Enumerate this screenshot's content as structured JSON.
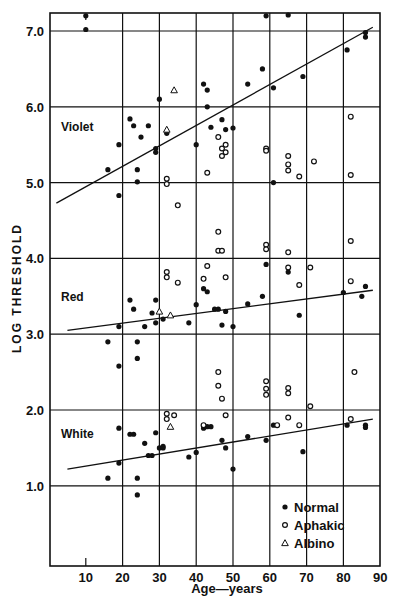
{
  "chart_data": {
    "type": "scatter",
    "title": "",
    "xlabel": "Age—years",
    "ylabel": "LOG THRESHOLD",
    "xlim": [
      2,
      90
    ],
    "ylim": [
      0,
      7.25
    ],
    "x_ticks": [
      10,
      20,
      30,
      40,
      50,
      60,
      70,
      80,
      90
    ],
    "y_ticks": [
      1.0,
      2.0,
      3.0,
      4.0,
      5.0,
      6.0,
      7.0
    ],
    "y_tick_labels": [
      "1.0",
      "2.0",
      "3.0",
      "4.0",
      "5.0",
      "6.0",
      "7.0"
    ],
    "grid": true,
    "legend_position": "lower right (inside)",
    "legend": [
      {
        "label": "Normal",
        "marker": "filled-circle"
      },
      {
        "label": "Aphakic",
        "marker": "open-circle"
      },
      {
        "label": "Albino",
        "marker": "open-triangle"
      }
    ],
    "group_labels": [
      {
        "text": "Violet",
        "age": 5,
        "value": 5.75
      },
      {
        "text": "Red",
        "age": 5,
        "value": 3.5
      },
      {
        "text": "White",
        "age": 5,
        "value": 1.7
      }
    ],
    "regression_lines": [
      {
        "name": "Violet",
        "x": [
          2,
          88
        ],
        "y": [
          4.73,
          7.05
        ]
      },
      {
        "name": "Red",
        "x": [
          5,
          88
        ],
        "y": [
          3.05,
          3.58
        ]
      },
      {
        "name": "White",
        "x": [
          5,
          88
        ],
        "y": [
          1.22,
          1.88
        ]
      }
    ],
    "series": [
      {
        "name": "Normal",
        "group": "Violet",
        "marker": "filled-circle",
        "points": [
          [
            10,
            7.2
          ],
          [
            10,
            7.02
          ],
          [
            16,
            5.17
          ],
          [
            19,
            5.5
          ],
          [
            19,
            4.83
          ],
          [
            22,
            5.84
          ],
          [
            23,
            5.75
          ],
          [
            24,
            5.17
          ],
          [
            24,
            5.01
          ],
          [
            25,
            5.6
          ],
          [
            27,
            5.75
          ],
          [
            29,
            5.4
          ],
          [
            29,
            5.45
          ],
          [
            30,
            6.1
          ],
          [
            32,
            5.65
          ],
          [
            40,
            5.5
          ],
          [
            42,
            6.3
          ],
          [
            43,
            6.22
          ],
          [
            43,
            6.0
          ],
          [
            44,
            5.73
          ],
          [
            47,
            5.83
          ],
          [
            48,
            5.7
          ],
          [
            50,
            5.72
          ],
          [
            54,
            6.3
          ],
          [
            58,
            6.5
          ],
          [
            59,
            7.2
          ],
          [
            61,
            6.25
          ],
          [
            61,
            5.0
          ],
          [
            65,
            7.22
          ],
          [
            69,
            6.4
          ],
          [
            81,
            6.75
          ],
          [
            86,
            6.92
          ],
          [
            86,
            6.98
          ]
        ]
      },
      {
        "name": "Aphakic",
        "group": "Violet",
        "marker": "open-circle",
        "points": [
          [
            32,
            5.05
          ],
          [
            32,
            4.98
          ],
          [
            35,
            4.7
          ],
          [
            43,
            5.13
          ],
          [
            46,
            5.6
          ],
          [
            47,
            5.45
          ],
          [
            47,
            5.35
          ],
          [
            48,
            5.5
          ],
          [
            48,
            5.4
          ],
          [
            59,
            5.45
          ],
          [
            59,
            5.42
          ],
          [
            65,
            5.35
          ],
          [
            65,
            5.24
          ],
          [
            65,
            5.16
          ],
          [
            68,
            5.08
          ],
          [
            72,
            5.28
          ],
          [
            82,
            5.87
          ],
          [
            82,
            5.1
          ]
        ]
      },
      {
        "name": "Albino",
        "group": "Violet",
        "marker": "open-triangle",
        "points": [
          [
            34,
            6.22
          ],
          [
            32,
            5.7
          ]
        ]
      },
      {
        "name": "Normal",
        "group": "Red",
        "marker": "filled-circle",
        "points": [
          [
            16,
            2.9
          ],
          [
            19,
            3.1
          ],
          [
            19,
            2.58
          ],
          [
            22,
            3.45
          ],
          [
            23,
            3.33
          ],
          [
            24,
            2.9
          ],
          [
            24,
            2.68
          ],
          [
            26,
            3.1
          ],
          [
            28,
            3.28
          ],
          [
            29,
            3.15
          ],
          [
            29,
            3.45
          ],
          [
            31,
            3.2
          ],
          [
            38,
            3.15
          ],
          [
            40,
            3.39
          ],
          [
            42,
            3.6
          ],
          [
            43,
            3.56
          ],
          [
            45,
            3.33
          ],
          [
            46,
            3.33
          ],
          [
            47,
            3.12
          ],
          [
            48,
            3.3
          ],
          [
            50,
            3.1
          ],
          [
            54,
            3.4
          ],
          [
            58,
            3.5
          ],
          [
            59,
            3.92
          ],
          [
            65,
            3.82
          ],
          [
            68,
            3.25
          ],
          [
            80,
            3.55
          ],
          [
            85,
            3.5
          ],
          [
            86,
            3.63
          ]
        ]
      },
      {
        "name": "Aphakic",
        "group": "Red",
        "marker": "open-circle",
        "points": [
          [
            32,
            3.82
          ],
          [
            32,
            3.75
          ],
          [
            35,
            3.68
          ],
          [
            42,
            3.73
          ],
          [
            43,
            3.9
          ],
          [
            46,
            4.35
          ],
          [
            46,
            4.1
          ],
          [
            47,
            4.1
          ],
          [
            48,
            3.75
          ],
          [
            59,
            4.18
          ],
          [
            59,
            4.12
          ],
          [
            65,
            4.08
          ],
          [
            65,
            3.88
          ],
          [
            68,
            3.65
          ],
          [
            71,
            3.88
          ],
          [
            82,
            4.23
          ],
          [
            82,
            3.7
          ]
        ]
      },
      {
        "name": "Albino",
        "group": "Red",
        "marker": "open-triangle",
        "points": [
          [
            30,
            3.3
          ],
          [
            33,
            3.25
          ]
        ]
      },
      {
        "name": "Normal",
        "group": "White",
        "marker": "filled-circle",
        "points": [
          [
            16,
            1.1
          ],
          [
            19,
            1.76
          ],
          [
            19,
            1.3
          ],
          [
            22,
            1.68
          ],
          [
            23,
            1.68
          ],
          [
            24,
            0.88
          ],
          [
            24,
            1.1
          ],
          [
            26,
            1.56
          ],
          [
            27,
            1.4
          ],
          [
            28,
            1.4
          ],
          [
            29,
            1.7
          ],
          [
            30,
            1.5
          ],
          [
            31,
            1.5
          ],
          [
            31,
            1.52
          ],
          [
            38,
            1.38
          ],
          [
            40,
            1.44
          ],
          [
            42,
            1.76
          ],
          [
            43,
            1.78
          ],
          [
            44,
            1.78
          ],
          [
            47,
            1.6
          ],
          [
            48,
            1.5
          ],
          [
            50,
            1.22
          ],
          [
            54,
            1.65
          ],
          [
            59,
            1.6
          ],
          [
            61,
            1.8
          ],
          [
            69,
            1.45
          ],
          [
            81,
            1.8
          ],
          [
            86,
            1.8
          ],
          [
            86,
            1.77
          ]
        ]
      },
      {
        "name": "Aphakic",
        "group": "White",
        "marker": "open-circle",
        "points": [
          [
            32,
            1.95
          ],
          [
            32,
            1.88
          ],
          [
            34,
            1.93
          ],
          [
            42,
            1.8
          ],
          [
            46,
            2.5
          ],
          [
            46,
            2.32
          ],
          [
            47,
            2.15
          ],
          [
            48,
            1.93
          ],
          [
            59,
            2.38
          ],
          [
            59,
            2.28
          ],
          [
            59,
            2.2
          ],
          [
            62,
            1.8
          ],
          [
            65,
            2.29
          ],
          [
            65,
            2.22
          ],
          [
            65,
            1.9
          ],
          [
            68,
            1.8
          ],
          [
            71,
            2.05
          ],
          [
            82,
            1.88
          ],
          [
            83,
            2.5
          ]
        ]
      },
      {
        "name": "Albino",
        "group": "White",
        "marker": "open-triangle",
        "points": [
          [
            33,
            1.78
          ]
        ]
      }
    ]
  },
  "axes": {
    "xlabel": "Age—years",
    "ylabel": "LOG THRESHOLD"
  },
  "colors": {
    "ink": "#111111",
    "background": "#ffffff"
  }
}
